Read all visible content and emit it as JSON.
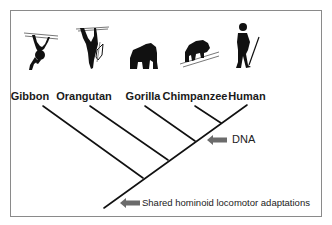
{
  "diagram": {
    "type": "cladogram",
    "taxa": [
      {
        "name": "Gibbon",
        "icon": "gibbon-silhouette-icon"
      },
      {
        "name": "Orangutan",
        "icon": "orangutan-silhouette-icon"
      },
      {
        "name": "Gorilla",
        "icon": "gorilla-silhouette-icon"
      },
      {
        "name": "Chimpanzee",
        "icon": "chimpanzee-silhouette-icon"
      },
      {
        "name": "Human",
        "icon": "human-silhouette-icon"
      }
    ],
    "annotations": [
      {
        "text": "DNA",
        "icon": "left-arrow-icon"
      },
      {
        "text": "Shared hominoid locomotor adaptations",
        "icon": "left-arrow-icon"
      }
    ],
    "colors": {
      "line": "#111111",
      "arrow": "#6b6b6b",
      "border": "#8a8a8a",
      "silhouette": "#111111"
    }
  }
}
